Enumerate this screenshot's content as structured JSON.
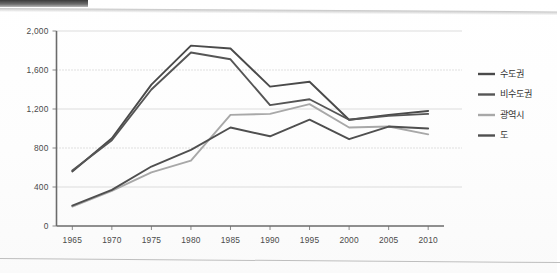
{
  "chart_data": {
    "type": "line",
    "title": "",
    "subtitle": "",
    "xlabel": "",
    "ylabel": "",
    "x": [
      1965,
      1970,
      1975,
      1980,
      1985,
      1990,
      1995,
      2000,
      2005,
      2010
    ],
    "categories": [
      "1965",
      "1970",
      "1975",
      "1980",
      "1985",
      "1990",
      "1995",
      "2000",
      "2005",
      "2010"
    ],
    "xlim": [
      1963,
      2012
    ],
    "ylim": [
      0,
      2000
    ],
    "yticks": [
      0,
      400,
      800,
      1200,
      1600,
      2000
    ],
    "ytick_labels": [
      "0",
      "400",
      "800",
      "1,200",
      "1,600",
      "2,000"
    ],
    "grid": "horizontal-dotted",
    "legend_position": "right",
    "series": [
      {
        "name": "수도권",
        "color": "#4a4a4a",
        "values": [
          560,
          900,
          1450,
          1850,
          1820,
          1430,
          1480,
          1090,
          1140,
          1180
        ]
      },
      {
        "name": "비수도권",
        "color": "#555555",
        "values": [
          570,
          880,
          1400,
          1780,
          1710,
          1240,
          1300,
          1090,
          1130,
          1150
        ]
      },
      {
        "name": "광역시",
        "color": "#a8a8a8",
        "values": [
          200,
          360,
          550,
          670,
          1140,
          1150,
          1250,
          1010,
          1020,
          940
        ]
      },
      {
        "name": "도",
        "color": "#4f4f4f",
        "values": [
          210,
          370,
          610,
          780,
          1010,
          920,
          1090,
          890,
          1020,
          1000
        ]
      }
    ]
  },
  "legend": {
    "items": [
      {
        "label": "수도권"
      },
      {
        "label": "비수도권"
      },
      {
        "label": "광역시"
      },
      {
        "label": "도"
      }
    ]
  },
  "axes": {
    "y_tick_labels": [
      "2,000",
      "1,600",
      "1,200",
      "800",
      "400",
      "0"
    ],
    "x_tick_labels": [
      "1965",
      "1970",
      "1975",
      "1980",
      "1985",
      "1990",
      "1995",
      "2000",
      "2005",
      "2010"
    ]
  },
  "colors": {
    "series_1": "#4a4a4a",
    "series_2": "#555555",
    "series_3": "#a8a8a8",
    "series_4": "#4f4f4f",
    "axis": "#6b6b6b",
    "grid": "#bdbdbd",
    "background": "#fdfdfc"
  }
}
